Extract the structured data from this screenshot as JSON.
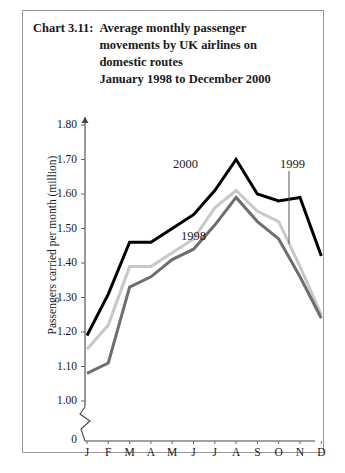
{
  "figure": {
    "chart_number": "Chart 3.11:",
    "title_lines": [
      "Average monthly passenger",
      "movements by UK airlines on",
      "domestic routes",
      "January 1998 to December 2000"
    ]
  },
  "chart_data": {
    "type": "line",
    "title": "Chart 3.11: Average monthly passenger movements by UK airlines on domestic routes January 1998 to December 2000",
    "xlabel": "",
    "ylabel": "Passengers carried per month (million)",
    "categories": [
      "J",
      "F",
      "M",
      "A",
      "M",
      "J",
      "J",
      "A",
      "S",
      "O",
      "N",
      "D"
    ],
    "month_names": [
      "January",
      "February",
      "March",
      "April",
      "May",
      "June",
      "July",
      "August",
      "September",
      "October",
      "November",
      "December"
    ],
    "ylim": [
      1.0,
      1.8
    ],
    "ytick_labels": [
      "1.80",
      "1.70",
      "1.60",
      "1.50",
      "1.40",
      "1.30",
      "1.20",
      "1.10",
      "1.00"
    ],
    "ytick_values": [
      1.8,
      1.7,
      1.6,
      1.5,
      1.4,
      1.3,
      1.2,
      1.1,
      1.0
    ],
    "origin_label": "0",
    "axis_break": true,
    "grid": false,
    "legend_position": "inline-annotations",
    "series": [
      {
        "name": "2000",
        "color": "#000000",
        "width": 3.0,
        "values": [
          1.19,
          1.31,
          1.46,
          1.46,
          1.5,
          1.54,
          1.61,
          1.7,
          1.6,
          1.58,
          1.59,
          1.42
        ]
      },
      {
        "name": "1999",
        "color": "#c8c8c8",
        "width": 3.0,
        "values": [
          1.15,
          1.22,
          1.39,
          1.39,
          1.43,
          1.47,
          1.56,
          1.61,
          1.55,
          1.52,
          1.39,
          1.25
        ]
      },
      {
        "name": "1998",
        "color": "#6e6e6e",
        "width": 3.0,
        "values": [
          1.08,
          1.11,
          1.33,
          1.36,
          1.41,
          1.44,
          1.51,
          1.59,
          1.52,
          1.47,
          1.36,
          1.24
        ]
      }
    ],
    "annotations": [
      {
        "text": "2000",
        "series": "2000",
        "x_px": 172,
        "y_px": 157,
        "leader": false
      },
      {
        "text": "1998",
        "series": "1998",
        "x_px": 180,
        "y_px": 229,
        "leader": false
      },
      {
        "text": "1999",
        "series": "1999",
        "x_px": 279,
        "y_px": 157,
        "leader": true,
        "leader_x": 288,
        "leader_y1": 170,
        "leader_y2": 243
      }
    ]
  }
}
